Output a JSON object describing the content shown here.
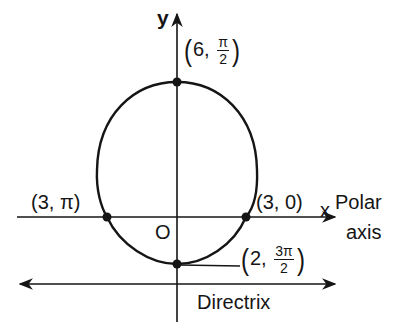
{
  "diagram": {
    "type": "polar conic (ellipse) with directrix",
    "axes": {
      "y_label": "y",
      "x_label": "x",
      "polar_axis_label_line1": "Polar",
      "polar_axis_label_line2": "axis",
      "origin_label": "O"
    },
    "points": [
      {
        "id": "top",
        "r": "6",
        "theta_num": "π",
        "theta_den": "2",
        "label_prefix": "6,",
        "display": "(6, π/2)"
      },
      {
        "id": "left",
        "display": "(3, π)"
      },
      {
        "id": "right",
        "display": "(3, 0)"
      },
      {
        "id": "bottom",
        "r": "2",
        "theta_num": "3π",
        "theta_den": "2",
        "label_prefix": "2,",
        "display": "(2, 3π/2)"
      }
    ],
    "directrix_label": "Directrix",
    "colors": {
      "ink": "#151515",
      "background": "#ffffff"
    }
  }
}
